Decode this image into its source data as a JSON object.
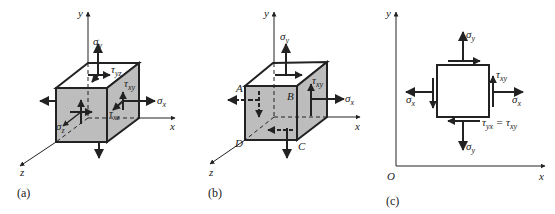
{
  "figure": {
    "panels": [
      {
        "id": "a",
        "caption": "(a)",
        "axes": {
          "x": "x",
          "y": "y",
          "z": "z"
        },
        "labels": {
          "sigma_y": {
            "sym": "σ",
            "sub": "y"
          },
          "tau_yz": {
            "sym": "τ",
            "sub": "yz"
          },
          "tau_xy": {
            "sym": "τ",
            "sub": "xy"
          },
          "sigma_x": {
            "sym": "σ",
            "sub": "x"
          },
          "tau_xz": {
            "sym": "τ",
            "sub": "xz"
          },
          "sigma_z": {
            "sym": "σ",
            "sub": "z"
          }
        }
      },
      {
        "id": "b",
        "caption": "(b)",
        "axes": {
          "x": "x",
          "y": "y",
          "z": "z"
        },
        "corners": {
          "A": "A",
          "B": "B",
          "C": "C",
          "D": "D"
        },
        "labels": {
          "sigma_y": {
            "sym": "σ",
            "sub": "y"
          },
          "tau_xy": {
            "sym": "τ",
            "sub": "xy"
          },
          "sigma_x": {
            "sym": "σ",
            "sub": "x"
          }
        }
      },
      {
        "id": "c",
        "caption": "(c)",
        "axes": {
          "x": "x",
          "y": "y",
          "origin": "O"
        },
        "labels": {
          "sigma_y_top": {
            "sym": "σ",
            "sub": "y"
          },
          "sigma_y_bottom": {
            "sym": "σ",
            "sub": "y"
          },
          "sigma_x_left": {
            "sym": "σ",
            "sub": "x"
          },
          "sigma_x_right": {
            "sym": "σ",
            "sub": "x"
          },
          "tau_xy": {
            "sym": "τ",
            "sub": "xy"
          },
          "tau_eq": {
            "lhs_sym": "τ",
            "lhs_sub": "yx",
            "eq": " = ",
            "rhs_sym": "τ",
            "rhs_sub": "xy"
          }
        }
      }
    ],
    "colors": {
      "ink": "#222222",
      "face": "#bdbdbd",
      "background": "#ffffff"
    }
  }
}
